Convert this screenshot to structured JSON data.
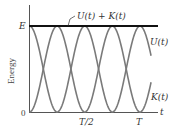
{
  "chart_data": {
    "type": "line",
    "title": "",
    "xlabel": "t",
    "ylabel": "Energy",
    "x_ticks": [
      "0",
      "T/2",
      "T"
    ],
    "y_ticks": [
      "0",
      "E"
    ],
    "x_range": [
      0,
      1.2
    ],
    "y_range": [
      0,
      1
    ],
    "grid": false,
    "legend_position": "inline labels at right",
    "series": [
      {
        "name": "U(t) + K(t)",
        "formula": "E (constant)",
        "x": [
          0,
          0.25,
          0.5,
          0.75,
          1.0,
          1.2
        ],
        "values": [
          1,
          1,
          1,
          1,
          1,
          1
        ],
        "color": "#111111"
      },
      {
        "name": "U(t)",
        "formula": "E cos^2(2πt/T)",
        "x": [
          0,
          0.125,
          0.25,
          0.375,
          0.5,
          0.625,
          0.75,
          0.875,
          1.0,
          1.1
        ],
        "values": [
          1,
          0.5,
          0,
          0.5,
          1,
          0.5,
          0,
          0.5,
          1,
          0.65
        ],
        "color": "#7a7a7a"
      },
      {
        "name": "K(t)",
        "formula": "E sin^2(2πt/T)",
        "x": [
          0,
          0.125,
          0.25,
          0.375,
          0.5,
          0.625,
          0.75,
          0.875,
          1.0,
          1.1
        ],
        "values": [
          0,
          0.5,
          1,
          0.5,
          0,
          0.5,
          1,
          0.5,
          0,
          0.35
        ],
        "color": "#7a7a7a"
      }
    ],
    "annotations": [
      "U(t) + K(t)",
      "U(t)",
      "K(t)"
    ]
  },
  "labels": {
    "ylabel": "Energy",
    "xlabel": "t",
    "y_top": "E",
    "y_zero": "0",
    "x_half": "T/2",
    "x_full": "T",
    "total": "U(t) + K(t)",
    "potential": "U(t)",
    "kinetic": "K(t)"
  }
}
